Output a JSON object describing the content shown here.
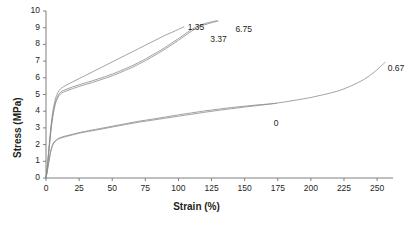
{
  "chart_data": {
    "type": "line",
    "title": "",
    "xlabel": "Strain (%)",
    "ylabel": "Stress (MPa)",
    "xlim": [
      0,
      262
    ],
    "ylim": [
      0,
      10
    ],
    "xticks": [
      0,
      25,
      50,
      75,
      100,
      125,
      150,
      175,
      200,
      225,
      250
    ],
    "yticks": [
      0,
      1,
      2,
      3,
      4,
      5,
      6,
      7,
      8,
      9,
      10
    ],
    "grid": false,
    "legend_position": "inline-end-labels",
    "line_color": "#8c8c8c",
    "axis_color": "#808080",
    "text_color": "#231f20",
    "series": [
      {
        "name": "1.35",
        "label": "1.35",
        "label_x": 107,
        "label_y": 9.05,
        "points": [
          [
            0,
            0
          ],
          [
            1,
            0.7
          ],
          [
            2,
            1.6
          ],
          [
            3,
            2.5
          ],
          [
            4,
            3.3
          ],
          [
            5,
            3.9
          ],
          [
            6,
            4.35
          ],
          [
            7,
            4.7
          ],
          [
            8,
            4.95
          ],
          [
            10,
            5.25
          ],
          [
            12,
            5.4
          ],
          [
            15,
            5.55
          ],
          [
            20,
            5.75
          ],
          [
            25,
            5.95
          ],
          [
            30,
            6.15
          ],
          [
            35,
            6.35
          ],
          [
            40,
            6.55
          ],
          [
            45,
            6.75
          ],
          [
            50,
            6.95
          ],
          [
            55,
            7.15
          ],
          [
            60,
            7.35
          ],
          [
            65,
            7.55
          ],
          [
            70,
            7.75
          ],
          [
            75,
            7.95
          ],
          [
            80,
            8.15
          ],
          [
            85,
            8.35
          ],
          [
            90,
            8.55
          ],
          [
            95,
            8.72
          ],
          [
            100,
            8.9
          ],
          [
            104,
            9.05
          ]
        ]
      },
      {
        "name": "3.37",
        "label": "3.37",
        "label_x": 124,
        "label_y": 8.35,
        "points": [
          [
            0,
            0
          ],
          [
            1,
            0.65
          ],
          [
            2,
            1.5
          ],
          [
            3,
            2.35
          ],
          [
            4,
            3.1
          ],
          [
            5,
            3.7
          ],
          [
            6,
            4.15
          ],
          [
            7,
            4.5
          ],
          [
            8,
            4.75
          ],
          [
            10,
            5.05
          ],
          [
            12,
            5.2
          ],
          [
            15,
            5.3
          ],
          [
            20,
            5.45
          ],
          [
            25,
            5.58
          ],
          [
            30,
            5.7
          ],
          [
            35,
            5.82
          ],
          [
            40,
            5.95
          ],
          [
            45,
            6.08
          ],
          [
            50,
            6.22
          ],
          [
            55,
            6.38
          ],
          [
            60,
            6.55
          ],
          [
            65,
            6.72
          ],
          [
            70,
            6.92
          ],
          [
            75,
            7.12
          ],
          [
            80,
            7.35
          ],
          [
            85,
            7.58
          ],
          [
            90,
            7.82
          ],
          [
            95,
            8.08
          ],
          [
            100,
            8.35
          ],
          [
            105,
            8.62
          ],
          [
            110,
            8.9
          ],
          [
            115,
            9.1
          ],
          [
            120,
            9.25
          ],
          [
            125,
            9.35
          ],
          [
            129,
            9.42
          ]
        ]
      },
      {
        "name": "6.75",
        "label": "6.75",
        "label_x": 143,
        "label_y": 8.95,
        "points": [
          [
            0,
            0
          ],
          [
            1,
            0.6
          ],
          [
            2,
            1.45
          ],
          [
            3,
            2.25
          ],
          [
            4,
            3.0
          ],
          [
            5,
            3.6
          ],
          [
            6,
            4.05
          ],
          [
            7,
            4.4
          ],
          [
            8,
            4.65
          ],
          [
            10,
            4.95
          ],
          [
            12,
            5.1
          ],
          [
            15,
            5.2
          ],
          [
            20,
            5.35
          ],
          [
            25,
            5.48
          ],
          [
            30,
            5.6
          ],
          [
            35,
            5.72
          ],
          [
            40,
            5.85
          ],
          [
            45,
            5.98
          ],
          [
            50,
            6.12
          ],
          [
            55,
            6.28
          ],
          [
            60,
            6.45
          ],
          [
            65,
            6.62
          ],
          [
            70,
            6.82
          ],
          [
            75,
            7.02
          ],
          [
            80,
            7.25
          ],
          [
            85,
            7.48
          ],
          [
            90,
            7.72
          ],
          [
            95,
            7.98
          ],
          [
            100,
            8.25
          ],
          [
            105,
            8.52
          ],
          [
            110,
            8.8
          ],
          [
            115,
            9.02
          ],
          [
            120,
            9.18
          ],
          [
            125,
            9.3
          ],
          [
            130,
            9.4
          ]
        ]
      },
      {
        "name": "0",
        "label": "0",
        "label_x": 172,
        "label_y": 3.3,
        "points": [
          [
            0,
            0
          ],
          [
            1,
            0.45
          ],
          [
            2,
            0.95
          ],
          [
            3,
            1.4
          ],
          [
            4,
            1.75
          ],
          [
            5,
            2.0
          ],
          [
            6,
            2.15
          ],
          [
            8,
            2.3
          ],
          [
            10,
            2.4
          ],
          [
            15,
            2.52
          ],
          [
            20,
            2.62
          ],
          [
            25,
            2.72
          ],
          [
            30,
            2.8
          ],
          [
            40,
            2.95
          ],
          [
            50,
            3.1
          ],
          [
            60,
            3.25
          ],
          [
            70,
            3.4
          ],
          [
            80,
            3.52
          ],
          [
            90,
            3.65
          ],
          [
            100,
            3.78
          ],
          [
            110,
            3.9
          ],
          [
            120,
            4.02
          ],
          [
            130,
            4.12
          ],
          [
            140,
            4.22
          ],
          [
            150,
            4.3
          ],
          [
            160,
            4.38
          ],
          [
            170,
            4.44
          ],
          [
            174,
            4.47
          ]
        ]
      },
      {
        "name": "0.67",
        "label": "0.67",
        "label_x": 258,
        "label_y": 6.6,
        "points": [
          [
            0,
            0
          ],
          [
            1,
            0.4
          ],
          [
            2,
            0.9
          ],
          [
            3,
            1.35
          ],
          [
            4,
            1.7
          ],
          [
            5,
            1.95
          ],
          [
            6,
            2.1
          ],
          [
            8,
            2.25
          ],
          [
            10,
            2.35
          ],
          [
            15,
            2.48
          ],
          [
            20,
            2.58
          ],
          [
            25,
            2.68
          ],
          [
            30,
            2.76
          ],
          [
            40,
            2.9
          ],
          [
            50,
            3.05
          ],
          [
            60,
            3.2
          ],
          [
            70,
            3.34
          ],
          [
            80,
            3.46
          ],
          [
            90,
            3.58
          ],
          [
            100,
            3.7
          ],
          [
            110,
            3.82
          ],
          [
            120,
            3.94
          ],
          [
            130,
            4.05
          ],
          [
            140,
            4.15
          ],
          [
            150,
            4.25
          ],
          [
            160,
            4.34
          ],
          [
            170,
            4.44
          ],
          [
            180,
            4.55
          ],
          [
            190,
            4.68
          ],
          [
            200,
            4.82
          ],
          [
            210,
            5.0
          ],
          [
            220,
            5.2
          ],
          [
            230,
            5.5
          ],
          [
            240,
            5.9
          ],
          [
            248,
            6.35
          ],
          [
            254,
            6.78
          ],
          [
            256,
            6.92
          ]
        ]
      }
    ]
  },
  "axes": {
    "y_title": "Stress (MPa)",
    "x_title": "Strain (%)",
    "y_tick_labels": [
      "10",
      "9",
      "8",
      "7",
      "6",
      "5",
      "4",
      "3",
      "2",
      "1",
      "0"
    ],
    "x_tick_labels": [
      "0",
      "25",
      "50",
      "75",
      "100",
      "125",
      "150",
      "175",
      "200",
      "225",
      "250"
    ]
  }
}
